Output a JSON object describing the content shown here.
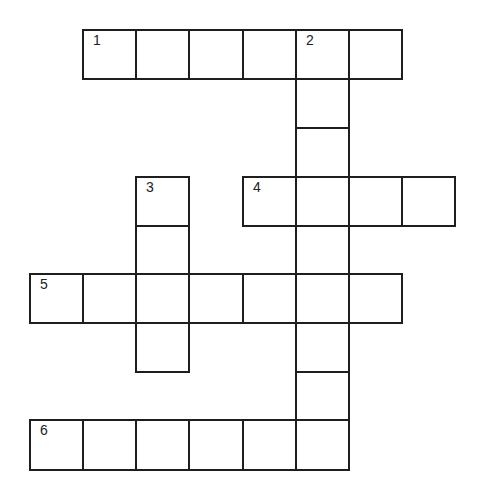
{
  "puzzle": {
    "type": "crossword",
    "rows": 9,
    "cols": 9,
    "cells": [
      {
        "r": 0,
        "c": 1,
        "num": "1",
        "value": ""
      },
      {
        "r": 0,
        "c": 2,
        "num": "",
        "value": ""
      },
      {
        "r": 0,
        "c": 3,
        "num": "",
        "value": ""
      },
      {
        "r": 0,
        "c": 4,
        "num": "",
        "value": ""
      },
      {
        "r": 0,
        "c": 5,
        "num": "2",
        "value": ""
      },
      {
        "r": 0,
        "c": 6,
        "num": "",
        "value": ""
      },
      {
        "r": 1,
        "c": 5,
        "num": "",
        "value": ""
      },
      {
        "r": 2,
        "c": 5,
        "num": "",
        "value": ""
      },
      {
        "r": 3,
        "c": 2,
        "num": "3",
        "value": ""
      },
      {
        "r": 3,
        "c": 4,
        "num": "4",
        "value": ""
      },
      {
        "r": 3,
        "c": 5,
        "num": "",
        "value": ""
      },
      {
        "r": 3,
        "c": 6,
        "num": "",
        "value": ""
      },
      {
        "r": 3,
        "c": 7,
        "num": "",
        "value": ""
      },
      {
        "r": 4,
        "c": 2,
        "num": "",
        "value": ""
      },
      {
        "r": 4,
        "c": 5,
        "num": "",
        "value": ""
      },
      {
        "r": 5,
        "c": 0,
        "num": "5",
        "value": ""
      },
      {
        "r": 5,
        "c": 1,
        "num": "",
        "value": ""
      },
      {
        "r": 5,
        "c": 2,
        "num": "",
        "value": ""
      },
      {
        "r": 5,
        "c": 3,
        "num": "",
        "value": ""
      },
      {
        "r": 5,
        "c": 4,
        "num": "",
        "value": ""
      },
      {
        "r": 5,
        "c": 5,
        "num": "",
        "value": ""
      },
      {
        "r": 5,
        "c": 6,
        "num": "",
        "value": ""
      },
      {
        "r": 6,
        "c": 2,
        "num": "",
        "value": ""
      },
      {
        "r": 6,
        "c": 5,
        "num": "",
        "value": ""
      },
      {
        "r": 7,
        "c": 5,
        "num": "",
        "value": ""
      },
      {
        "r": 8,
        "c": 0,
        "num": "6",
        "value": ""
      },
      {
        "r": 8,
        "c": 1,
        "num": "",
        "value": ""
      },
      {
        "r": 8,
        "c": 2,
        "num": "",
        "value": ""
      },
      {
        "r": 8,
        "c": 3,
        "num": "",
        "value": ""
      },
      {
        "r": 8,
        "c": 4,
        "num": "",
        "value": ""
      },
      {
        "r": 8,
        "c": 5,
        "num": "",
        "value": ""
      }
    ],
    "words": [
      {
        "num": "1",
        "direction": "across",
        "length": 6
      },
      {
        "num": "2",
        "direction": "down",
        "length": 9
      },
      {
        "num": "3",
        "direction": "down",
        "length": 4
      },
      {
        "num": "4",
        "direction": "across",
        "length": 4
      },
      {
        "num": "5",
        "direction": "across",
        "length": 7
      },
      {
        "num": "6",
        "direction": "across",
        "length": 6
      }
    ],
    "colors": {
      "line": "#1e1e1e",
      "background": "#ffffff",
      "number": "#222222"
    }
  }
}
